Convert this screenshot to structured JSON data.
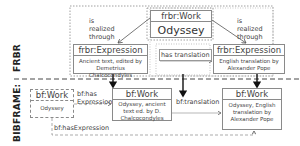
{
  "side_labels": {
    "frbr": "FRBR",
    "bibframe": "BIBFRAME:"
  },
  "frbr": {
    "work": {
      "type": "frbr:Work",
      "title": "Odyssey"
    },
    "expression_left": {
      "type": "frbr:Expression",
      "description": "Ancient text, edited by Demetrius Chalcocondyles"
    },
    "expression_right": {
      "type": "frbr:Expression",
      "description": "English translation by Alexander Pope"
    },
    "rel_realized_left": "is realized through",
    "rel_realized_right": "is realized through",
    "rel_translation": "has translation"
  },
  "bibframe": {
    "work_source": {
      "type": "bf:Work",
      "title": "Odyssey"
    },
    "work_middle": {
      "type": "bf:Work",
      "description": "Odyssey, ancient text ed. by D. Chalcocondyles"
    },
    "work_right": {
      "type": "bf:Work",
      "description": "Odyssey, English translation by Alexander Pope"
    },
    "rel_has_expression": "bf:has Expression",
    "rel_translation": "bf:translation",
    "rel_has_expression_bottom": "bf:hasExpression"
  }
}
